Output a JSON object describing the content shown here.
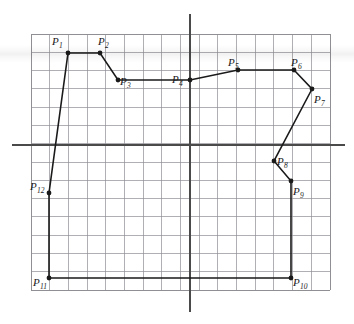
{
  "figure": {
    "background_color": "#ffffff",
    "grid": {
      "visible": true,
      "color": "#8f8f94",
      "border_color": "#8f8f94",
      "left_px": 31,
      "top_px": 34,
      "right_px": 330,
      "bottom_px": 290,
      "columns": 16,
      "rows": 14,
      "cell_width_px": 18.69,
      "cell_height_px": 18.29
    },
    "axes": {
      "color": "#4a4a4a",
      "x_axis": {
        "label": "",
        "y_px": 145,
        "x_start_px": 12,
        "x_end_px": 345
      },
      "y_axis": {
        "label": "",
        "x_px": 190,
        "y_start_px": 14,
        "y_end_px": 312
      }
    },
    "polyline": {
      "stroke_color": "#1a1a1a",
      "stroke_width": 1.6,
      "closed": true,
      "marker": "filled-dot",
      "marker_color": "#1a1a1a",
      "marker_radius_px": 2.4
    }
  },
  "chart_data": {
    "type": "scatter",
    "xlabel": "",
    "ylabel": "",
    "grid": true,
    "legend": "none",
    "xlim": [
      -8.5,
      7.5
    ],
    "ylim": [
      -7.5,
      6.5
    ],
    "point_labels": [
      "P1",
      "P2",
      "P3",
      "P4",
      "P5",
      "P6",
      "P7",
      "P8",
      "P9",
      "P10",
      "P11",
      "P12"
    ],
    "label_texts": [
      "P",
      "P",
      "P",
      "P",
      "P",
      "P",
      "P",
      "P",
      "P",
      "P",
      "P",
      "P"
    ],
    "label_subscripts": [
      "1",
      "2",
      "3",
      "4",
      "5",
      "6",
      "7",
      "8",
      "9",
      "10",
      "11",
      "12"
    ],
    "points_px": [
      {
        "name": "P1",
        "x": 68,
        "y": 53,
        "label_x": 52,
        "label_y": 36
      },
      {
        "name": "P2",
        "x": 100,
        "y": 53,
        "label_x": 98,
        "label_y": 36
      },
      {
        "name": "P3",
        "x": 118,
        "y": 80,
        "label_x": 120,
        "label_y": 76
      },
      {
        "name": "P4",
        "x": 190,
        "y": 80,
        "label_x": 172,
        "label_y": 74
      },
      {
        "name": "P5",
        "x": 238,
        "y": 70,
        "label_x": 228,
        "label_y": 57
      },
      {
        "name": "P6",
        "x": 294,
        "y": 70,
        "label_x": 291,
        "label_y": 57
      },
      {
        "name": "P7",
        "x": 312,
        "y": 89,
        "label_x": 314,
        "label_y": 94
      },
      {
        "name": "P8",
        "x": 274,
        "y": 161,
        "label_x": 277,
        "label_y": 156
      },
      {
        "name": "P9",
        "x": 291,
        "y": 181,
        "label_x": 293,
        "label_y": 186
      },
      {
        "name": "P10",
        "x": 291,
        "y": 278,
        "label_x": 293,
        "label_y": 277
      },
      {
        "name": "P11",
        "x": 49,
        "y": 278,
        "label_x": 33,
        "label_y": 277
      },
      {
        "name": "P12",
        "x": 49,
        "y": 193,
        "label_x": 30,
        "label_y": 181
      }
    ],
    "points_data": [
      {
        "name": "P1",
        "x": -6.5,
        "y": 3.5
      },
      {
        "name": "P2",
        "x": -4.8,
        "y": 3.5
      },
      {
        "name": "P3",
        "x": -3.9,
        "y": 2.0
      },
      {
        "name": "P4",
        "x": 0.0,
        "y": 2.0
      },
      {
        "name": "P5",
        "x": 2.6,
        "y": 2.6
      },
      {
        "name": "P6",
        "x": 5.6,
        "y": 2.6
      },
      {
        "name": "P7",
        "x": 6.5,
        "y": 1.5
      },
      {
        "name": "P8",
        "x": 4.5,
        "y": -0.9
      },
      {
        "name": "P9",
        "x": 5.4,
        "y": -2.0
      },
      {
        "name": "P10",
        "x": 5.4,
        "y": -7.3
      },
      {
        "name": "P11",
        "x": -7.5,
        "y": -7.3
      },
      {
        "name": "P12",
        "x": -7.5,
        "y": -2.6
      }
    ]
  }
}
